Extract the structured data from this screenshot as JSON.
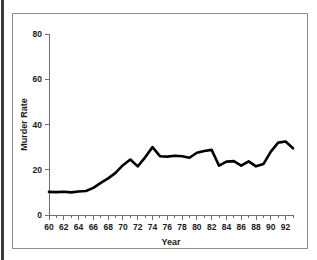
{
  "figure": {
    "background_color": "#ffffff",
    "frame_color": "#8e8e8e",
    "line_color": "#000000"
  },
  "chart_data": {
    "type": "line",
    "title": "",
    "xlabel": "Year",
    "ylabel": "Murder Rate",
    "xlim": [
      60,
      93
    ],
    "ylim": [
      0,
      80
    ],
    "grid": false,
    "legend": null,
    "y_ticks": [
      0,
      20,
      40,
      60,
      80
    ],
    "y_tick_labels": [
      "0",
      "20",
      "40",
      "60",
      "80"
    ],
    "x_ticks": [
      60,
      62,
      64,
      66,
      68,
      70,
      72,
      74,
      76,
      78,
      80,
      82,
      84,
      86,
      88,
      90,
      92
    ],
    "x_tick_labels": [
      "60",
      "62",
      "64",
      "66",
      "68",
      "70",
      "72",
      "74",
      "76",
      "78",
      "80",
      "82",
      "84",
      "86",
      "88",
      "90",
      "92"
    ],
    "x_minor_ticks": [
      61,
      63,
      65,
      67,
      69,
      71,
      73,
      75,
      77,
      79,
      81,
      83,
      85,
      87,
      89,
      91,
      93
    ],
    "x": [
      60,
      61,
      62,
      63,
      64,
      65,
      66,
      67,
      68,
      69,
      70,
      71,
      72,
      73,
      74,
      75,
      76,
      77,
      78,
      79,
      80,
      81,
      82,
      83,
      84,
      85,
      86,
      87,
      88,
      89,
      90,
      91,
      92,
      93
    ],
    "values": [
      10.2,
      10.1,
      10.3,
      10.0,
      10.4,
      10.6,
      12.0,
      14.2,
      16.2,
      18.6,
      22.0,
      24.5,
      21.5,
      25.5,
      30.0,
      26.0,
      25.8,
      26.2,
      26.0,
      25.3,
      27.5,
      28.3,
      28.8,
      21.8,
      23.6,
      23.8,
      21.8,
      23.7,
      21.5,
      22.5,
      28.0,
      32.0,
      32.5,
      29.5
    ],
    "series_name": "Murder Rate"
  }
}
